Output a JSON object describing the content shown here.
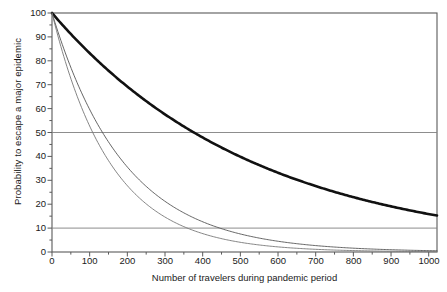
{
  "chart_data": {
    "type": "line",
    "title": "",
    "xlabel": "Number of travelers during pandemic period",
    "ylabel": "Probability to escape a major epidemic",
    "xlim": [
      0,
      1022
    ],
    "ylim": [
      0,
      100
    ],
    "xticks": [
      0,
      100,
      200,
      300,
      400,
      500,
      600,
      700,
      800,
      900,
      1000
    ],
    "yticks": [
      0,
      10,
      20,
      30,
      40,
      50,
      60,
      70,
      80,
      90,
      100
    ],
    "grid": false,
    "legend_position": "none",
    "reference_lines": [
      {
        "name": "fifty-percent-line",
        "axis": "y",
        "value": 50,
        "color": "#808080"
      },
      {
        "name": "ten-percent-line",
        "axis": "y",
        "value": 10,
        "color": "#808080"
      }
    ],
    "x": [
      0,
      50,
      100,
      150,
      200,
      250,
      300,
      350,
      400,
      450,
      500,
      550,
      600,
      650,
      700,
      750,
      800,
      850,
      900,
      950,
      1000,
      1022
    ],
    "series": [
      {
        "name": "thick-curve",
        "style": "thick-solid",
        "color": "#111111",
        "width": 2.6,
        "decay_rate": 0.00184,
        "values": [
          100,
          91.2,
          83.2,
          75.9,
          69.2,
          63.1,
          57.6,
          52.5,
          47.9,
          43.7,
          39.9,
          36.3,
          33.2,
          30.2,
          27.6,
          25.2,
          22.9,
          20.9,
          19.1,
          17.4,
          15.9,
          15.3
        ]
      },
      {
        "name": "middle-thin-curve",
        "style": "thin-solid",
        "color": "#555555",
        "width": 0.9,
        "decay_rate": 0.00517,
        "values": [
          100,
          77.3,
          59.7,
          46.1,
          35.6,
          27.5,
          21.3,
          16.4,
          12.7,
          9.8,
          7.6,
          5.8,
          4.5,
          3.5,
          2.7,
          2.1,
          1.6,
          1.2,
          0.95,
          0.73,
          0.57,
          0.51
        ]
      },
      {
        "name": "lower-thin-curve",
        "style": "thin-solid",
        "color": "#777777",
        "width": 0.9,
        "decay_rate": 0.00641,
        "values": [
          100,
          72.6,
          52.7,
          38.2,
          27.7,
          20.1,
          14.6,
          10.6,
          7.7,
          5.6,
          4.1,
          2.9,
          2.1,
          1.6,
          1.1,
          0.8,
          0.6,
          0.43,
          0.31,
          0.23,
          0.16,
          0.14
        ]
      }
    ]
  },
  "axes": {
    "frame_color": "#5a5a5a",
    "tick_color": "#5a5a5a"
  }
}
